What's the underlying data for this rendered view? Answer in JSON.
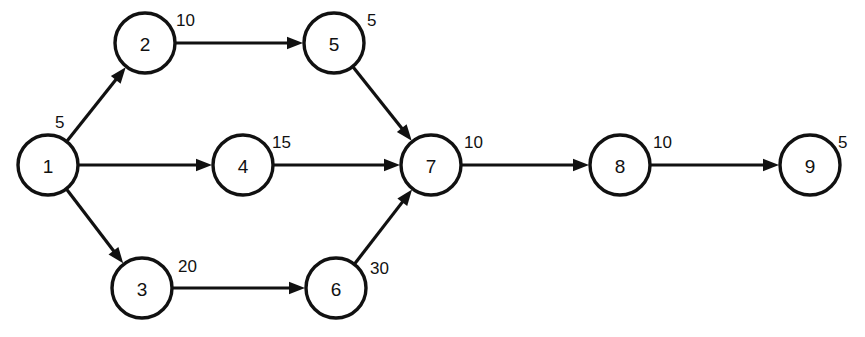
{
  "diagram": {
    "type": "directed-network",
    "background_color": "#ffffff",
    "stroke_color": "#111111",
    "node_fill": "#ffffff",
    "node_radius": 30,
    "canvas": {
      "width": 865,
      "height": 337
    }
  },
  "nodes": [
    {
      "id": "1",
      "label": "1",
      "x": 48,
      "y": 165
    },
    {
      "id": "2",
      "label": "2",
      "x": 145,
      "y": 43
    },
    {
      "id": "3",
      "label": "3",
      "x": 142,
      "y": 288
    },
    {
      "id": "4",
      "label": "4",
      "x": 243,
      "y": 165
    },
    {
      "id": "5",
      "label": "5",
      "x": 334,
      "y": 43
    },
    {
      "id": "6",
      "label": "6",
      "x": 336,
      "y": 288
    },
    {
      "id": "7",
      "label": "7",
      "x": 431,
      "y": 165
    },
    {
      "id": "8",
      "label": "8",
      "x": 620,
      "y": 165
    },
    {
      "id": "9",
      "label": "9",
      "x": 810,
      "y": 165
    }
  ],
  "edges": [
    {
      "id": "e1-2",
      "from": "1",
      "to": "2",
      "label": "5",
      "label_x": 55,
      "label_y": 128
    },
    {
      "id": "e1-4",
      "from": "1",
      "to": "4",
      "label": "",
      "label_x": 0,
      "label_y": 0
    },
    {
      "id": "e1-3",
      "from": "1",
      "to": "3",
      "label": "",
      "label_x": 0,
      "label_y": 0
    },
    {
      "id": "e2-5",
      "from": "2",
      "to": "5",
      "label": "10",
      "label_x": 176,
      "label_y": 26
    },
    {
      "id": "e5-7",
      "from": "5",
      "to": "7",
      "label": "5",
      "label_x": 367,
      "label_y": 26
    },
    {
      "id": "e4-7",
      "from": "4",
      "to": "7",
      "label": "15",
      "label_x": 272,
      "label_y": 148
    },
    {
      "id": "e3-6",
      "from": "3",
      "to": "6",
      "label": "20",
      "label_x": 178,
      "label_y": 272
    },
    {
      "id": "e6-7",
      "from": "6",
      "to": "7",
      "label": "30",
      "label_x": 370,
      "label_y": 274
    },
    {
      "id": "e7-8",
      "from": "7",
      "to": "8",
      "label": "10",
      "label_x": 464,
      "label_y": 148
    },
    {
      "id": "e8-9",
      "from": "8",
      "to": "9",
      "label": "10",
      "label_x": 653,
      "label_y": 148
    }
  ],
  "annotations": [
    {
      "id": "a-node9",
      "label": "5",
      "x": 838,
      "y": 148,
      "attached_to": "9"
    }
  ]
}
